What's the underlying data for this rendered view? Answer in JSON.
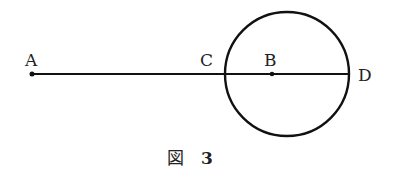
{
  "diagram": {
    "points": {
      "A": {
        "label": "A",
        "x": 32,
        "y": 74
      },
      "B": {
        "label": "B",
        "x": 272,
        "y": 74
      },
      "C": {
        "label": "C",
        "x": 225,
        "y": 74
      },
      "D": {
        "label": "D",
        "x": 349,
        "y": 74
      }
    },
    "segment": {
      "from": "A",
      "to": "D"
    },
    "circle": {
      "cx": 287,
      "cy": 74,
      "r": 62
    },
    "caption": {
      "prefix": "図",
      "number": "3"
    }
  }
}
